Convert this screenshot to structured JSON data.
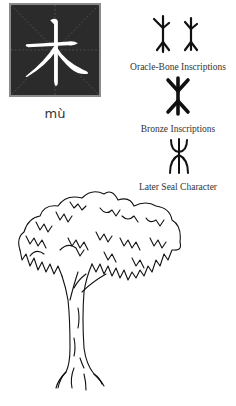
{
  "character": {
    "hanzi": "木",
    "pinyin": "mù",
    "card_background": "#2b2b2b",
    "card_border": "#8a8a8a",
    "glyph_color": "#ffffff"
  },
  "evolution": [
    {
      "label": "Oracle-Bone Inscriptions",
      "glyph_count": 2
    },
    {
      "label": "Bronze Inscriptions",
      "glyph_count": 1
    },
    {
      "label": "Later Seal Character",
      "glyph_count": 1
    }
  ],
  "illustration": {
    "subject": "tree-sketch"
  }
}
